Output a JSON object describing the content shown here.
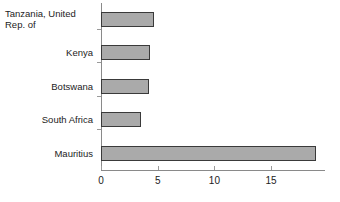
{
  "chart_data": {
    "type": "bar",
    "orientation": "horizontal",
    "title": "",
    "xlabel": "",
    "ylabel": "",
    "categories": [
      "Tanzania, United\nRep. of",
      "Kenya",
      "Botswana",
      "South Africa",
      "Mauritius"
    ],
    "values": [
      4.7,
      4.3,
      4.2,
      3.5,
      19.0
    ],
    "xlim": [
      0,
      19.75
    ],
    "xticks": [
      0,
      5,
      10,
      15
    ],
    "xtick_labels": [
      "0",
      "5",
      "10",
      "15"
    ],
    "grid": false,
    "legend": false,
    "bar_fill_color": "#aaaaaa",
    "bar_border_color": "#3a3a3a",
    "axis_color": "#8a8a8a",
    "background_color": "#ffffff"
  },
  "axis": {
    "ticks": [
      {
        "label": "0",
        "value": 0
      },
      {
        "label": "5",
        "value": 5
      },
      {
        "label": "10",
        "value": 10
      },
      {
        "label": "15",
        "value": 15
      }
    ]
  },
  "bars": [
    {
      "label": "Tanzania, United\nRep. of",
      "value": 4.7,
      "wrapped": true
    },
    {
      "label": "Kenya",
      "value": 4.3,
      "wrapped": false
    },
    {
      "label": "Botswana",
      "value": 4.2,
      "wrapped": false
    },
    {
      "label": "South Africa",
      "value": 3.5,
      "wrapped": false
    },
    {
      "label": "Mauritius",
      "value": 19.0,
      "wrapped": false
    }
  ]
}
